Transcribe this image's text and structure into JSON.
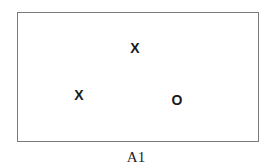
{
  "figure": {
    "caption": "A1",
    "marks": [
      {
        "symbol": "X",
        "x": 135,
        "y": 48
      },
      {
        "symbol": "X",
        "x": 79,
        "y": 95
      },
      {
        "symbol": "O",
        "x": 177,
        "y": 100
      }
    ]
  }
}
